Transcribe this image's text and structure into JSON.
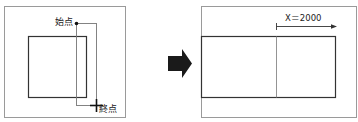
{
  "before": {
    "start_label": "始点",
    "end_label": "終点"
  },
  "after": {
    "dimension_label": "X＝2000"
  },
  "colors": {
    "frame": "#9a9a9a",
    "shape": "#333333",
    "selection": "#777777",
    "arrow": "#1a1a1a"
  }
}
